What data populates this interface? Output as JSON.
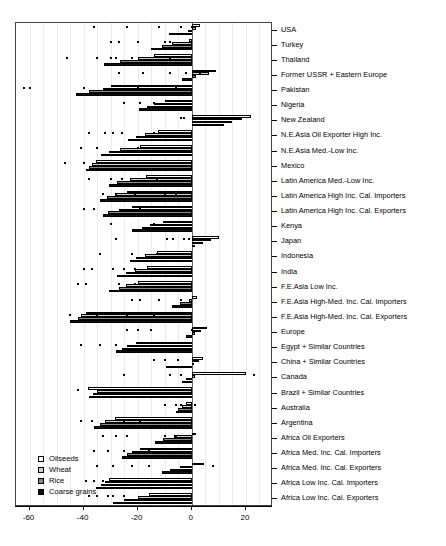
{
  "chart_data": {
    "type": "bar",
    "orientation": "horizontal",
    "title": "",
    "subtitle": "",
    "xlabel": "",
    "ylabel": "",
    "xlim": [
      -65,
      30
    ],
    "xticks": [
      -60,
      -40,
      -20,
      0,
      20
    ],
    "xticklabels": [
      "-60",
      "-40",
      "-20",
      "0",
      "20"
    ],
    "grid": "vertical-light",
    "legend": {
      "position": "bottom-left",
      "entries": [
        {
          "label": "Oilseeds",
          "color": "#ffffff"
        },
        {
          "label": "Wheat",
          "color": "#d0d0d0"
        },
        {
          "label": "Rice",
          "color": "#8a8a8a"
        },
        {
          "label": "Coarse grains",
          "color": "#101010"
        }
      ]
    },
    "series_order": [
      "Oilseeds",
      "Wheat",
      "Rice",
      "Coarse grains"
    ],
    "categories": [
      "USA",
      "Turkey",
      "Thailand",
      "Former USSR + Eastern Europe",
      "Pakistan",
      "Nigeria",
      "New Zealand",
      "N.E.Asia Oil Exporter High Inc.",
      "N.E.Asia Med.-Low Inc.",
      "Mexico",
      "Latin America Med.-Low Inc.",
      "Latin America High Inc. Cal. Importers",
      "Latin America High Inc. Cal. Exporters",
      "Kenya",
      "Japan",
      "Indonesia",
      "India",
      "F.E.Asia Low Inc.",
      "F.E.Asia High-Med. Inc. Cal. Importers",
      "F.E.Asia High-Med. Inc. Cal. Exporters",
      "Europe",
      "Egypt + Similar Countries",
      "China + Similar Countries",
      "Canada",
      "Brazil + Similar Countries",
      "Australia",
      "Argentina",
      "Africa Oil Exporters",
      "Africa Med. Inc. Cal. Importers",
      "Africa Med. Inc. Cal. Exporters",
      "Africa Low Inc. Cal. Importers",
      "Africa Low Inc. Cal. Exporters"
    ],
    "series": [
      {
        "name": "Oilseeds",
        "values": [
          3.0,
          -1.0,
          -14.0,
          9.0,
          -30.0,
          -10.0,
          22.0,
          -12.5,
          -19.0,
          -35.5,
          -17.0,
          -24.0,
          -22.0,
          -10.5,
          10.0,
          -13.0,
          -16.5,
          -20.0,
          2.0,
          -39.0,
          5.5,
          -20.5,
          4.0,
          20.0,
          -38.5,
          -2.0,
          -28.5,
          1.5,
          -19.0,
          4.5,
          -30.5,
          -16.0
        ]
      },
      {
        "name": "Wheat",
        "values": [
          1.5,
          -7.5,
          -20.0,
          6.5,
          -33.0,
          -14.0,
          18.5,
          -17.5,
          -26.5,
          -37.0,
          -23.0,
          -28.5,
          -27.0,
          -15.5,
          7.0,
          -17.5,
          -21.0,
          -24.5,
          -1.0,
          -41.0,
          3.5,
          -24.0,
          2.5,
          1.0,
          -35.0,
          -3.5,
          -32.0,
          -6.5,
          -22.0,
          -4.5,
          -32.0,
          -20.0
        ]
      },
      {
        "name": "Rice",
        "values": [
          -1.5,
          -11.0,
          -26.5,
          1.5,
          -38.0,
          -16.5,
          15.0,
          -20.5,
          -30.5,
          -38.0,
          -27.5,
          -31.5,
          -31.0,
          -18.5,
          4.0,
          -20.5,
          -24.5,
          -27.0,
          -4.5,
          -42.0,
          1.0,
          -26.0,
          0.5,
          -2.0,
          -36.5,
          -5.0,
          -34.0,
          -10.5,
          -24.0,
          -8.0,
          -33.5,
          -25.0
        ]
      },
      {
        "name": "Coarse grains",
        "values": [
          -8.5,
          -15.0,
          -32.5,
          -3.5,
          -43.0,
          -19.5,
          12.0,
          -23.5,
          -33.5,
          -39.0,
          -30.5,
          -34.0,
          -33.0,
          -22.0,
          1.0,
          -23.0,
          -27.5,
          -30.5,
          -7.5,
          -45.0,
          -2.0,
          -28.0,
          -9.5,
          -3.5,
          -38.0,
          -6.0,
          -36.0,
          -13.5,
          -26.0,
          -11.0,
          -35.5,
          -29.0
        ]
      }
    ],
    "markers": {
      "description": "scatter points overlaid on bar rows",
      "points": [
        [
          -36,
          0
        ],
        [
          -24,
          0
        ],
        [
          -12,
          0
        ],
        [
          -4,
          0
        ],
        [
          0,
          0
        ],
        [
          -30,
          1
        ],
        [
          -27,
          1
        ],
        [
          -20,
          1
        ],
        [
          -8,
          1
        ],
        [
          -10,
          1
        ],
        [
          -46,
          2
        ],
        [
          -35,
          2
        ],
        [
          -30,
          2
        ],
        [
          -28,
          2
        ],
        [
          -22,
          2
        ],
        [
          -8,
          2
        ],
        [
          -27,
          3
        ],
        [
          -18,
          3
        ],
        [
          -8,
          3
        ],
        [
          -2,
          3
        ],
        [
          3,
          3
        ],
        [
          -62,
          4
        ],
        [
          -60,
          4
        ],
        [
          -40,
          4
        ],
        [
          -20,
          4
        ],
        [
          -6,
          4
        ],
        [
          -25,
          5
        ],
        [
          -19,
          5
        ],
        [
          -14,
          5
        ],
        [
          -4,
          6
        ],
        [
          -3,
          6
        ],
        [
          2,
          6
        ],
        [
          10,
          6
        ],
        [
          -38,
          7
        ],
        [
          -32,
          7
        ],
        [
          -29,
          7
        ],
        [
          -26,
          7
        ],
        [
          -14,
          7
        ],
        [
          -41,
          8
        ],
        [
          -35,
          8
        ],
        [
          -20,
          8
        ],
        [
          -47,
          9
        ],
        [
          -40,
          9
        ],
        [
          -23,
          9
        ],
        [
          -6,
          9
        ],
        [
          -38,
          10
        ],
        [
          -30,
          10
        ],
        [
          -26,
          10
        ],
        [
          -13,
          10
        ],
        [
          -33,
          11
        ],
        [
          -28,
          11
        ],
        [
          -21,
          11
        ],
        [
          -10,
          11
        ],
        [
          -6,
          11
        ],
        [
          -40,
          12
        ],
        [
          -36,
          12
        ],
        [
          -19,
          12
        ],
        [
          -30,
          13
        ],
        [
          -14,
          13
        ],
        [
          -28,
          14
        ],
        [
          -9,
          14
        ],
        [
          -7,
          14
        ],
        [
          -3,
          14
        ],
        [
          -1,
          14
        ],
        [
          -34,
          15
        ],
        [
          -22,
          15
        ],
        [
          -13,
          15
        ],
        [
          -9,
          15
        ],
        [
          -5,
          15
        ],
        [
          -40,
          16
        ],
        [
          -37,
          16
        ],
        [
          -29,
          16
        ],
        [
          -25,
          16
        ],
        [
          -21,
          16
        ],
        [
          -42,
          17
        ],
        [
          -39,
          17
        ],
        [
          -27,
          17
        ],
        [
          -21,
          17
        ],
        [
          -22,
          18
        ],
        [
          -19,
          18
        ],
        [
          -12,
          18
        ],
        [
          -4,
          18
        ],
        [
          -45,
          19
        ],
        [
          -35,
          19
        ],
        [
          -24,
          19
        ],
        [
          -14,
          19
        ],
        [
          -24,
          20
        ],
        [
          -20,
          20
        ],
        [
          -15,
          20
        ],
        [
          0,
          20
        ],
        [
          -41,
          21
        ],
        [
          -34,
          21
        ],
        [
          -28,
          21
        ],
        [
          -14,
          22
        ],
        [
          -10,
          22
        ],
        [
          -5,
          22
        ],
        [
          -25,
          23
        ],
        [
          -8,
          23
        ],
        [
          -4,
          23
        ],
        [
          23,
          23
        ],
        [
          -42,
          24
        ],
        [
          -34,
          24
        ],
        [
          -22,
          24
        ],
        [
          -13,
          24
        ],
        [
          -10,
          25
        ],
        [
          -6,
          25
        ],
        [
          -4,
          25
        ],
        [
          1,
          25
        ],
        [
          -41,
          26
        ],
        [
          -37,
          26
        ],
        [
          -25,
          26
        ],
        [
          -19,
          26
        ],
        [
          -33,
          27
        ],
        [
          -28,
          27
        ],
        [
          -24,
          27
        ],
        [
          -10,
          27
        ],
        [
          -6,
          27
        ],
        [
          -36,
          28
        ],
        [
          -31,
          28
        ],
        [
          -25,
          28
        ],
        [
          -16,
          28
        ],
        [
          -35,
          29
        ],
        [
          -29,
          29
        ],
        [
          -22,
          29
        ],
        [
          -16,
          29
        ],
        [
          8,
          29
        ],
        [
          -39,
          30
        ],
        [
          -36,
          30
        ],
        [
          -33,
          30
        ],
        [
          -28,
          30
        ],
        [
          -38,
          31
        ],
        [
          -35,
          31
        ],
        [
          -31,
          31
        ],
        [
          -29,
          31
        ],
        [
          -25,
          31
        ]
      ]
    }
  }
}
